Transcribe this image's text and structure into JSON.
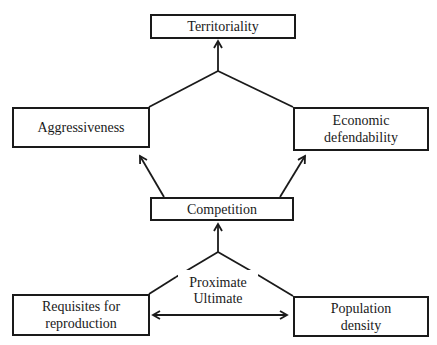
{
  "diagram": {
    "nodes": {
      "territoriality": "Territoriality",
      "aggressiveness": "Aggressiveness",
      "economic_defendability": [
        "Economic",
        "defendability"
      ],
      "competition": "Competition",
      "requisites_for_reproduction": [
        "Requisites for",
        "reproduction"
      ],
      "population_density": [
        "Population",
        "density"
      ]
    },
    "labels": {
      "proximate": "Proximate",
      "ultimate": "Ultimate"
    },
    "edges": [
      {
        "from": "aggressiveness",
        "to": "territoriality",
        "type": "merge-arrow"
      },
      {
        "from": "economic_defendability",
        "to": "territoriality",
        "type": "merge-arrow"
      },
      {
        "from": "competition",
        "to": "aggressiveness",
        "type": "arrow"
      },
      {
        "from": "competition",
        "to": "economic_defendability",
        "type": "arrow"
      },
      {
        "from": "requisites_for_reproduction",
        "to": "competition",
        "type": "merge-arrow"
      },
      {
        "from": "population_density",
        "to": "competition",
        "type": "merge-arrow"
      },
      {
        "from": "requisites_for_reproduction",
        "to": "population_density",
        "type": "double-arrow"
      }
    ]
  }
}
